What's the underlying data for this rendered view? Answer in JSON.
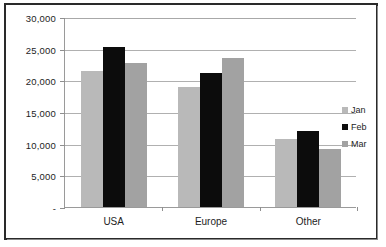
{
  "chart_data": {
    "type": "bar",
    "title": "",
    "subtitle": "",
    "xlabel": "",
    "ylabel": "",
    "categories": [
      "USA",
      "Europe",
      "Other"
    ],
    "series": [
      {
        "name": "Jan",
        "color": "#b9b9b9",
        "values": [
          21500,
          19000,
          10700
        ]
      },
      {
        "name": "Feb",
        "color": "#0c0c0c",
        "values": [
          25300,
          21200,
          12000
        ]
      },
      {
        "name": "Mar",
        "color": "#a2a2a2",
        "values": [
          22700,
          23500,
          9200
        ]
      }
    ],
    "ylim": [
      0,
      30000
    ],
    "yticks": [
      0,
      5000,
      10000,
      15000,
      20000,
      25000,
      30000
    ],
    "ytick_labels": [
      "-",
      "5,000",
      "10,000",
      "15,000",
      "20,000",
      "25,000",
      "30,000"
    ],
    "grid": true,
    "legend_position": "right",
    "legend_entries": [
      "Jan",
      "Feb",
      "Mar"
    ]
  }
}
